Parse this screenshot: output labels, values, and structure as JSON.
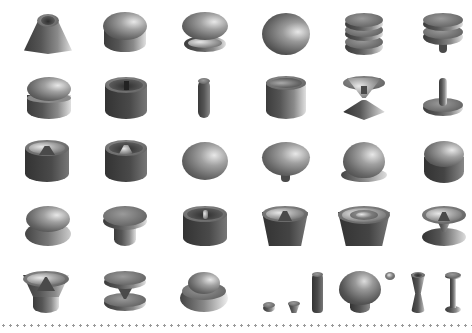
{
  "image": {
    "description": "Grid of 3D rendered knob / button shapes on white background",
    "rows": 5,
    "columns": 6,
    "last_row_items": 10,
    "palette": {
      "background": "#ffffff",
      "dark": "#3c3c3c",
      "mid": "#707070",
      "highlight": "#e8e8e8",
      "divider_dots": "#9a9a9a"
    }
  },
  "shapes": [
    {
      "row": 1,
      "col": 1,
      "kind": "cone-with-recess"
    },
    {
      "row": 1,
      "col": 2,
      "kind": "double-stacked-dome"
    },
    {
      "row": 1,
      "col": 3,
      "kind": "torus-on-dish"
    },
    {
      "row": 1,
      "col": 4,
      "kind": "dome"
    },
    {
      "row": 1,
      "col": 5,
      "kind": "triple-disc-stack"
    },
    {
      "row": 1,
      "col": 6,
      "kind": "double-disc-on-stem"
    },
    {
      "row": 2,
      "col": 1,
      "kind": "torus-on-cylinder"
    },
    {
      "row": 2,
      "col": 2,
      "kind": "cup-with-center-pin"
    },
    {
      "row": 2,
      "col": 3,
      "kind": "thin-rod"
    },
    {
      "row": 2,
      "col": 4,
      "kind": "hollow-cylinder"
    },
    {
      "row": 2,
      "col": 5,
      "kind": "cup-on-cone"
    },
    {
      "row": 2,
      "col": 6,
      "kind": "pin-on-disc"
    },
    {
      "row": 3,
      "col": 1,
      "kind": "cup-with-cone"
    },
    {
      "row": 3,
      "col": 2,
      "kind": "cup-with-cone-deep"
    },
    {
      "row": 3,
      "col": 3,
      "kind": "dome-flat"
    },
    {
      "row": 3,
      "col": 4,
      "kind": "dome-on-stem"
    },
    {
      "row": 3,
      "col": 5,
      "kind": "dome-with-rim"
    },
    {
      "row": 3,
      "col": 6,
      "kind": "double-dome"
    },
    {
      "row": 4,
      "col": 1,
      "kind": "torus-double-ring"
    },
    {
      "row": 4,
      "col": 2,
      "kind": "mushroom-disc"
    },
    {
      "row": 4,
      "col": 3,
      "kind": "cup-with-pin"
    },
    {
      "row": 4,
      "col": 4,
      "kind": "bowl-with-cone"
    },
    {
      "row": 4,
      "col": 5,
      "kind": "bowl-with-rings"
    },
    {
      "row": 4,
      "col": 6,
      "kind": "bowl-on-cone"
    },
    {
      "row": 5,
      "col": 1,
      "kind": "flared-cup-with-cone"
    },
    {
      "row": 5,
      "col": 2,
      "kind": "double-disc-spindle"
    },
    {
      "row": 5,
      "col": 3,
      "kind": "torus-in-ring"
    },
    {
      "row": 5,
      "col": 4,
      "kind": "small-pieces-set"
    },
    {
      "row": 5,
      "col": 5,
      "kind": "mushroom-knob-set"
    },
    {
      "row": 5,
      "col": 6,
      "kind": "spools"
    }
  ]
}
